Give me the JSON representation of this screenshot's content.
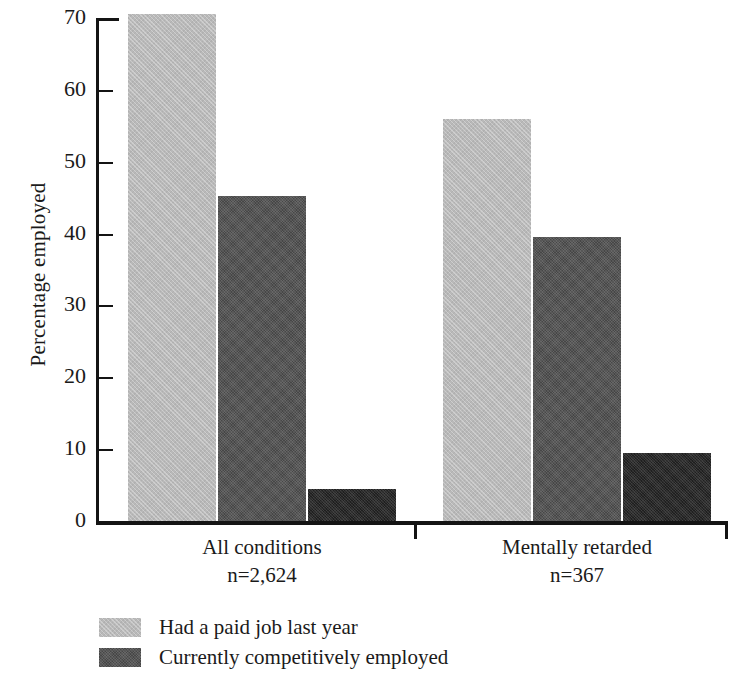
{
  "chart_data": {
    "type": "bar",
    "title": "",
    "subtitle": "",
    "xlabel": "",
    "ylabel": "Percentage employed",
    "ylim": [
      0,
      70
    ],
    "yticks": [
      0,
      10,
      20,
      30,
      40,
      50,
      60,
      70
    ],
    "ytick_labels": [
      "0",
      "10",
      "20",
      "30",
      "40",
      "50",
      "60",
      "70"
    ],
    "grid": false,
    "legend_position": "bottom-left",
    "categories": [
      "All conditions",
      "Mentally retarded"
    ],
    "category_sublabels": [
      "n=2,624",
      "n=367"
    ],
    "series": [
      {
        "name": "Had a paid job last year",
        "color": "#b9b9b9",
        "values": [
          70.5,
          56.0
        ]
      },
      {
        "name": "Currently competitively employed",
        "color": "#565656",
        "values": [
          45.2,
          39.5
        ]
      },
      {
        "name": "",
        "color": "#1f1f1f",
        "values": [
          4.5,
          9.4
        ]
      }
    ]
  },
  "axis": {
    "y_title": "Percentage employed"
  },
  "legend": {
    "items": [
      {
        "label": "Had a paid job last year",
        "swatch": "light"
      },
      {
        "label": "Currently competitively employed",
        "swatch": "mid"
      }
    ]
  }
}
